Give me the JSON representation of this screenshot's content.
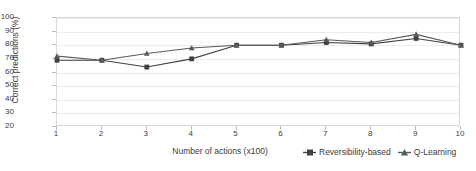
{
  "chart_data": {
    "type": "line",
    "title": "",
    "xlabel": "Number of actions (x100)",
    "ylabel": "Correct predictions (%)",
    "x": [
      1,
      2,
      3,
      4,
      5,
      6,
      7,
      8,
      9,
      10
    ],
    "xticklabels": [
      "1",
      "2",
      "3",
      "4",
      "5",
      "6",
      "7",
      "8",
      "9",
      "10"
    ],
    "yticklabels": [
      "20",
      "30",
      "40",
      "50",
      "60",
      "70",
      "80",
      "90",
      "100"
    ],
    "yticks": [
      20,
      30,
      40,
      50,
      60,
      70,
      80,
      90,
      100
    ],
    "xlim": [
      1,
      10
    ],
    "ylim": [
      20,
      100
    ],
    "grid": true,
    "legend_position": "bottom-right",
    "series": [
      {
        "name": "Reversibility-based",
        "marker": "square",
        "color": "#404040",
        "values": [
          69,
          69,
          64,
          70,
          80,
          80,
          82,
          81,
          85,
          80
        ]
      },
      {
        "name": "Q-Learning",
        "marker": "triangle",
        "color": "#595959",
        "values": [
          72,
          69,
          74,
          78,
          80,
          80,
          84,
          82,
          88,
          80
        ]
      }
    ]
  },
  "legend": {
    "items": [
      {
        "label": "Reversibility-based",
        "marker": "square-marker-icon"
      },
      {
        "label": "Q-Learning",
        "marker": "triangle-marker-icon"
      }
    ]
  }
}
